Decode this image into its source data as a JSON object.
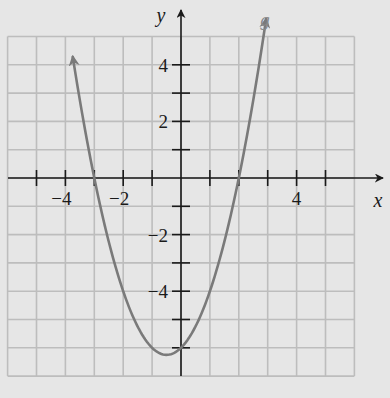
{
  "chart_data": {
    "type": "line",
    "title": "",
    "xlabel": "x",
    "ylabel": "y",
    "xlim": [
      -6,
      6
    ],
    "ylim": [
      -7,
      5
    ],
    "grid": true,
    "x_tick_labels": [
      {
        "value": -4,
        "label": "−4"
      },
      {
        "value": -2,
        "label": "−2"
      },
      {
        "value": 4,
        "label": "4"
      }
    ],
    "y_tick_labels": [
      {
        "value": 4,
        "label": "4"
      },
      {
        "value": 2,
        "label": "2"
      },
      {
        "value": -2,
        "label": "−2"
      },
      {
        "value": -4,
        "label": "−4"
      }
    ],
    "x_ticks": [
      -5,
      -4,
      -3,
      -2,
      -1,
      1,
      2,
      3,
      4,
      5
    ],
    "y_ticks": [
      -6,
      -5,
      -4,
      -3,
      -2,
      -1,
      1,
      2,
      3,
      4
    ],
    "series": [
      {
        "name": "g",
        "label": "g",
        "equation": "g(x) = x^2 + x - 6",
        "x": [
          -3.75,
          -3.5,
          -3,
          -2.5,
          -2,
          -1.5,
          -1,
          -0.5,
          0,
          0.5,
          1,
          1.5,
          2,
          2.5,
          2.95
        ],
        "y": [
          4.31,
          2.75,
          0,
          -2.25,
          -4,
          -5.25,
          -6,
          -6.25,
          -6,
          -5.25,
          -4,
          -2.25,
          0,
          2.75,
          5.65
        ],
        "x_intercepts": [
          -3,
          2
        ],
        "y_intercept": -6,
        "vertex": [
          -0.5,
          -6.25
        ],
        "color": "#7a7a7a",
        "arrows": "both ends"
      }
    ]
  },
  "colors": {
    "background": "#e6e6e6",
    "grid": "#bdbdbd",
    "axis": "#1a1a1a",
    "curve": "#7a7a7a"
  }
}
